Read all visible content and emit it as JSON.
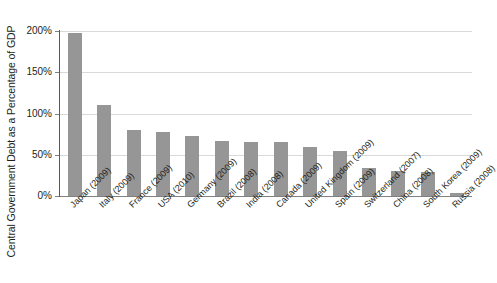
{
  "chart_data": {
    "type": "bar",
    "title": "",
    "xlabel": "",
    "ylabel": "Central Government Debt as a Percentage of GDP",
    "ylim": [
      0,
      200
    ],
    "ytick_labels": [
      "200%",
      "150%",
      "100%",
      "50%",
      "0%"
    ],
    "ytick_values": [
      200,
      150,
      100,
      50,
      0
    ],
    "grid": true,
    "legend": "none",
    "bar_color": "#969696",
    "gridline_color": "#d9d9d9",
    "axis_color": "#58595b",
    "categories": [
      "Japan (2009)",
      "Italy (2009)",
      "France (2009)",
      "USA (2010)",
      "Germany (2009)",
      "Brazil (2008)",
      "India (2008)",
      "Canada (2009)",
      "United Kingdom (2009)",
      "Spain (2009)",
      "Switzerland (2007)",
      "China (2008)",
      "South Korea (2009)",
      "Russia (2008)"
    ],
    "values": [
      198,
      110,
      80,
      78,
      73,
      67,
      66,
      65,
      60,
      55,
      34,
      30,
      29,
      4
    ]
  }
}
